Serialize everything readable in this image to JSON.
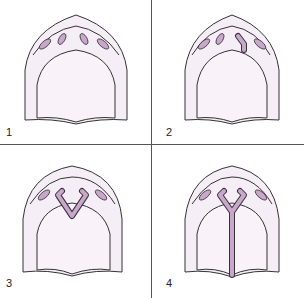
{
  "figure": {
    "panels": [
      {
        "label": "1",
        "stage": "separate palatal ridges"
      },
      {
        "label": "2",
        "stage": "one ridge extends"
      },
      {
        "label": "3",
        "stage": "V-shaped fusion"
      },
      {
        "label": "4",
        "stage": "Y-shaped fusion with midline seam"
      }
    ]
  },
  "colors": {
    "fill_light": "#f6eef6",
    "fill_inner": "#f9f3f9",
    "accent": "#c9a6cc",
    "stroke": "#333333",
    "divider": "#555555"
  }
}
